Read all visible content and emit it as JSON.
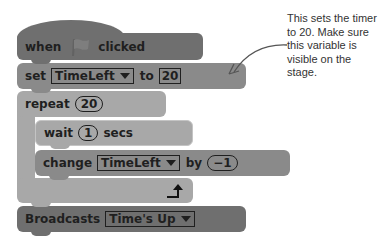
{
  "script": {
    "hat": {
      "before": "when",
      "icon": "green-flag-icon",
      "after": "clicked"
    },
    "set": {
      "label": "set",
      "variable": "TimeLeft",
      "to_label": "to",
      "value": "20"
    },
    "repeat": {
      "label": "repeat",
      "count": "20",
      "loop_icon": "loop-arrow-icon"
    },
    "wait": {
      "label": "wait",
      "value": "1",
      "unit": "secs"
    },
    "change": {
      "label": "change",
      "variable": "TimeLeft",
      "by_label": "by",
      "value": "−1"
    },
    "broadcast": {
      "label": "Broadcasts",
      "message": "Time's Up"
    }
  },
  "annotation": {
    "text": "This sets the timer to 20. Make sure this variable is visible on the stage."
  },
  "colors": {
    "events": "#6f6f6f",
    "data": "#8a8a8a",
    "control": "#a8a8a8"
  }
}
